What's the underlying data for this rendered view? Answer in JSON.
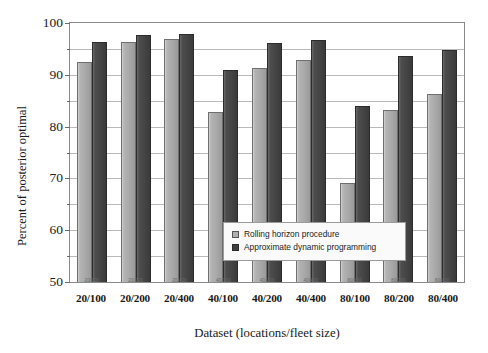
{
  "chart_data": {
    "type": "bar",
    "title": "",
    "xlabel": "Dataset (locations/fleet size)",
    "ylabel": "Percent of posterior optimal",
    "ylim": [
      50,
      100
    ],
    "ytick_step_major": 10,
    "ytick_step_minor": 5,
    "grid": true,
    "legend_position": "inside-bottom-right",
    "categories": [
      "20/100",
      "20/200",
      "20/400",
      "40/100",
      "40/200",
      "40/400",
      "80/100",
      "80/200",
      "80/400"
    ],
    "series": [
      {
        "name": "Rolling horizon procedure",
        "color": "#a9a9a9",
        "values": [
          92.5,
          96.4,
          97.0,
          82.8,
          91.4,
          92.9,
          69.2,
          83.3,
          86.3
        ]
      },
      {
        "name": "Approximate dynamic programming",
        "color": "#444444",
        "values": [
          96.4,
          97.6,
          97.9,
          91.0,
          96.2,
          96.8,
          83.9,
          93.7,
          94.7
        ]
      }
    ],
    "ytick_labels": [
      "100",
      "90",
      "80",
      "70",
      "60",
      "50"
    ],
    "ytick_values": [
      100,
      90,
      80,
      70,
      60,
      50
    ]
  },
  "axis": {
    "y_title": "Percent of posterior optimal",
    "x_title": "Dataset (locations/fleet size)"
  },
  "legend": {
    "items": [
      {
        "label": "Rolling horizon procedure",
        "swatch": "light-grey-square"
      },
      {
        "label": "Approximate dynamic programming",
        "swatch": "dark-grey-square"
      }
    ]
  }
}
